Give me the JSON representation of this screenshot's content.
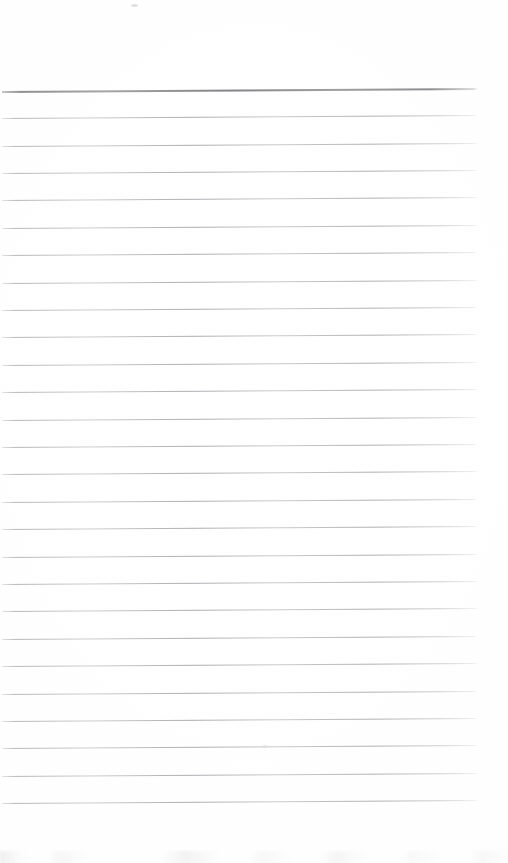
{
  "document": {
    "kind": "scanned-page",
    "content_type": "blank ruled notebook page",
    "page_width": 508,
    "page_height": 863,
    "background_color": "#fefefe",
    "text_content": "",
    "handwriting_present": "no",
    "printed_text_present": "no"
  },
  "ruling": {
    "line_count": 27,
    "first_line_y": 91,
    "line_spacing": 27.4,
    "line_start_x": 2,
    "line_end_x": 478,
    "tilt_degrees": -0.36,
    "body_line_color": "#a4a4aa",
    "body_line_thickness": 1,
    "header_rule_index": 0,
    "header_rule_color": "#808084",
    "header_rule_thickness": 2,
    "has_vertical_margin_rule": "no",
    "lines": [
      {
        "index": 0,
        "y": 91,
        "role": "header-rule"
      },
      {
        "index": 1,
        "y": 118,
        "role": "body-rule"
      },
      {
        "index": 2,
        "y": 146,
        "role": "body-rule"
      },
      {
        "index": 3,
        "y": 173,
        "role": "body-rule"
      },
      {
        "index": 4,
        "y": 200,
        "role": "body-rule"
      },
      {
        "index": 5,
        "y": 228,
        "role": "body-rule"
      },
      {
        "index": 6,
        "y": 255,
        "role": "body-rule"
      },
      {
        "index": 7,
        "y": 283,
        "role": "body-rule"
      },
      {
        "index": 8,
        "y": 310,
        "role": "body-rule"
      },
      {
        "index": 9,
        "y": 337,
        "role": "body-rule"
      },
      {
        "index": 10,
        "y": 365,
        "role": "body-rule"
      },
      {
        "index": 11,
        "y": 392,
        "role": "body-rule"
      },
      {
        "index": 12,
        "y": 420,
        "role": "body-rule"
      },
      {
        "index": 13,
        "y": 447,
        "role": "body-rule"
      },
      {
        "index": 14,
        "y": 474,
        "role": "body-rule"
      },
      {
        "index": 15,
        "y": 502,
        "role": "body-rule"
      },
      {
        "index": 16,
        "y": 529,
        "role": "body-rule"
      },
      {
        "index": 17,
        "y": 557,
        "role": "body-rule"
      },
      {
        "index": 18,
        "y": 584,
        "role": "body-rule"
      },
      {
        "index": 19,
        "y": 611,
        "role": "body-rule"
      },
      {
        "index": 20,
        "y": 639,
        "role": "body-rule"
      },
      {
        "index": 21,
        "y": 666,
        "role": "body-rule"
      },
      {
        "index": 22,
        "y": 694,
        "role": "body-rule"
      },
      {
        "index": 23,
        "y": 721,
        "role": "body-rule"
      },
      {
        "index": 24,
        "y": 748,
        "role": "body-rule"
      },
      {
        "index": 25,
        "y": 776,
        "role": "body-rule"
      },
      {
        "index": 26,
        "y": 803,
        "role": "body-rule"
      }
    ]
  },
  "margins": {
    "top_blank_height": 91,
    "bottom_blank_height": 60
  },
  "scan_artifacts": {
    "bottom_edge_smudges": "faint light-gray specks along the bottom edge",
    "top_speck": {
      "x": 131,
      "y": 4
    },
    "mid_speck": {
      "x": 262,
      "y": 745
    }
  }
}
